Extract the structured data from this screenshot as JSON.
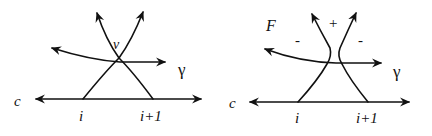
{
  "diagrams": [
    {
      "id": "left",
      "labels": {
        "curve": "c",
        "vertex": "v",
        "path": "γ",
        "left_point": "i",
        "right_point": "i+1"
      }
    },
    {
      "id": "right",
      "labels": {
        "curve": "c",
        "face": "F",
        "path": "γ",
        "left_point": "i",
        "right_point": "i+1",
        "sign_top": "+",
        "sign_left": "-",
        "sign_right": "-"
      }
    }
  ]
}
